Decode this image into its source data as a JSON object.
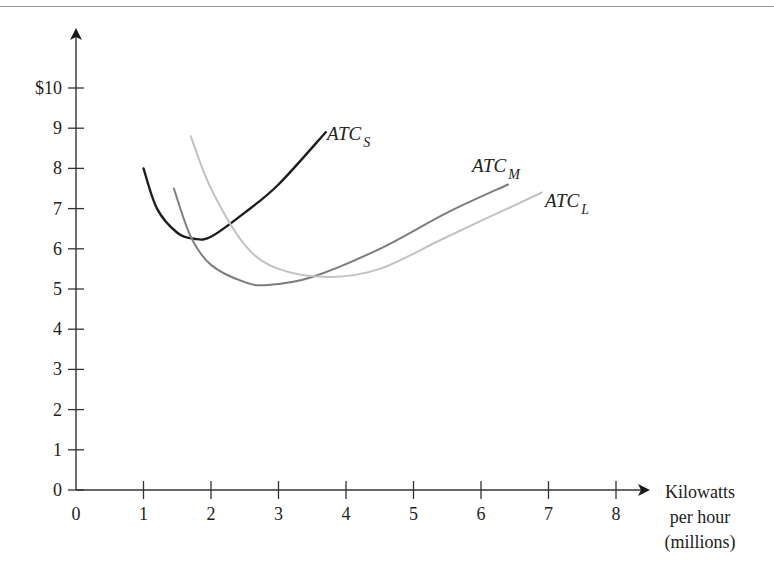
{
  "chart_data": {
    "type": "line",
    "title": "",
    "xlabel": "Kilowatts per hour (millions)",
    "xlabel_lines": [
      "Kilowatts",
      "per hour",
      "(millions)"
    ],
    "ylabel": "$",
    "xlim": [
      0,
      8
    ],
    "ylim": [
      0,
      10
    ],
    "x_ticks": [
      "0",
      "1",
      "2",
      "3",
      "4",
      "5",
      "6",
      "7",
      "8"
    ],
    "y_ticks": [
      "0",
      "1",
      "2",
      "3",
      "4",
      "5",
      "6",
      "7",
      "8",
      "9",
      "$10"
    ],
    "grid": false,
    "legend": "inline labels at curve ends",
    "series": [
      {
        "name": "ATC_S",
        "label_main": "ATC",
        "label_sub": "S",
        "color": "#1e1e1e",
        "points": [
          [
            1.0,
            8.0
          ],
          [
            1.2,
            7.0
          ],
          [
            1.5,
            6.4
          ],
          [
            1.75,
            6.25
          ],
          [
            2.0,
            6.3
          ],
          [
            2.5,
            6.9
          ],
          [
            3.0,
            7.6
          ],
          [
            3.7,
            8.9
          ]
        ]
      },
      {
        "name": "ATC_M",
        "label_main": "ATC",
        "label_sub": "M",
        "color": "#7d7d7d",
        "points": [
          [
            1.45,
            7.5
          ],
          [
            1.7,
            6.3
          ],
          [
            2.0,
            5.6
          ],
          [
            2.5,
            5.17
          ],
          [
            2.85,
            5.1
          ],
          [
            3.5,
            5.3
          ],
          [
            4.5,
            6.0
          ],
          [
            5.5,
            6.9
          ],
          [
            6.4,
            7.6
          ]
        ]
      },
      {
        "name": "ATC_L",
        "label_main": "ATC",
        "label_sub": "L",
        "color": "#c2c2c2",
        "points": [
          [
            1.7,
            8.8
          ],
          [
            2.0,
            7.5
          ],
          [
            2.5,
            6.1
          ],
          [
            3.0,
            5.5
          ],
          [
            3.75,
            5.3
          ],
          [
            4.5,
            5.5
          ],
          [
            5.5,
            6.3
          ],
          [
            6.9,
            7.4
          ]
        ]
      }
    ]
  }
}
